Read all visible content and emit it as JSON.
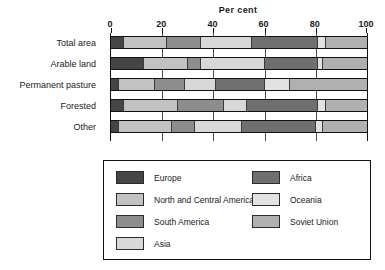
{
  "chart_data": {
    "type": "bar",
    "orientation": "horizontal",
    "stacked": true,
    "title": "Per cent",
    "xlabel": "Per cent",
    "ylabel": "",
    "xlim": [
      0,
      100
    ],
    "xticks": [
      0,
      20,
      40,
      60,
      80,
      100
    ],
    "xtick_labels": [
      "0",
      "20",
      "40",
      "60",
      "80",
      "100"
    ],
    "grid": true,
    "grid_axis": "x",
    "legend_position": "below",
    "categories": [
      "Total area",
      "Arable land",
      "Permanent pasture",
      "Forested",
      "Other"
    ],
    "series": [
      {
        "name": "Europe",
        "color": "#454545",
        "values": [
          5,
          13,
          3,
          5,
          3
        ]
      },
      {
        "name": "North and Central America",
        "color": "#c2c2c2",
        "values": [
          17,
          17,
          14,
          21,
          21
        ]
      },
      {
        "name": "South America",
        "color": "#8d8d8d",
        "values": [
          13,
          5,
          12,
          18,
          9
        ]
      },
      {
        "name": "Asia",
        "color": "#d8d8d8",
        "values": [
          20,
          25,
          12,
          9,
          18
        ]
      },
      {
        "name": "Africa",
        "color": "#6f6f6f",
        "values": [
          26,
          21,
          19,
          28,
          29
        ]
      },
      {
        "name": "Oceania",
        "color": "#e2e2e2",
        "values": [
          3,
          2,
          10,
          3,
          3
        ]
      },
      {
        "name": "Soviet Union",
        "color": "#b0b0b0",
        "values": [
          16,
          17,
          30,
          16,
          17
        ]
      }
    ]
  },
  "legend": {
    "entries": [
      {
        "label": "Europe",
        "color": "#454545"
      },
      {
        "label": "North and Central America",
        "color": "#c2c2c2"
      },
      {
        "label": "South America",
        "color": "#8d8d8d"
      },
      {
        "label": "Asia",
        "color": "#d8d8d8"
      },
      {
        "label": "Africa",
        "color": "#6f6f6f"
      },
      {
        "label": "Oceania",
        "color": "#e2e2e2"
      },
      {
        "label": "Soviet Union",
        "color": "#b0b0b0"
      }
    ]
  }
}
